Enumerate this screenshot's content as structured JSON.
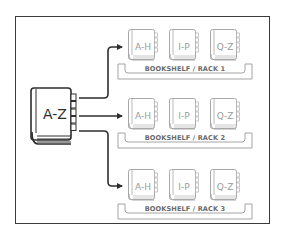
{
  "diagram": {
    "source_book": {
      "label": "A-Z",
      "icon": "book-icon"
    },
    "racks": [
      {
        "label": "BOOKSHELF / RACK 1",
        "books": [
          {
            "label": "A-H"
          },
          {
            "label": "I-P"
          },
          {
            "label": "Q-Z"
          }
        ]
      },
      {
        "label": "BOOKSHELF / RACK 2",
        "books": [
          {
            "label": "A-H"
          },
          {
            "label": "I-P"
          },
          {
            "label": "Q-Z"
          }
        ]
      },
      {
        "label": "BOOKSHELF / RACK 3",
        "books": [
          {
            "label": "A-H"
          },
          {
            "label": "I-P"
          },
          {
            "label": "Q-Z"
          }
        ]
      }
    ],
    "colors": {
      "frame": "#3a3a3a",
      "source_book": "#2e2e2e",
      "arrows": "#2e2e2e",
      "shelf_books": "#a8a8a8",
      "shelf": "#9a9a9a"
    }
  }
}
